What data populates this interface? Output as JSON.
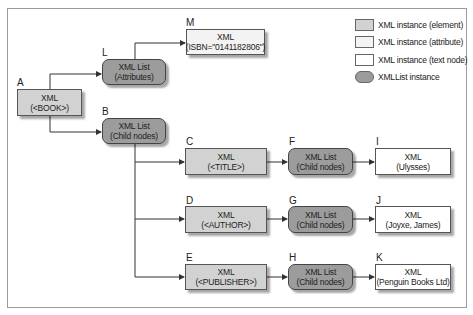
{
  "diagram": {
    "colors": {
      "element": "#d2d2d2",
      "attribute": "#f3f3f3",
      "text_node": "#ffffff",
      "list": "#9c9c9c",
      "line": "#333333"
    },
    "nodes": {
      "A": {
        "letter": "A",
        "type": "element",
        "line1": "XML",
        "line2": "(<BOOK>)"
      },
      "L": {
        "letter": "L",
        "type": "list",
        "line1": "XML List",
        "line2": "(Attributes)"
      },
      "M": {
        "letter": "M",
        "type": "attribute",
        "line1": "XML",
        "line2": "(ISBN=\"0141182806\")"
      },
      "B": {
        "letter": "B",
        "type": "list",
        "line1": "XML List",
        "line2": "(Child nodes)"
      },
      "C": {
        "letter": "C",
        "type": "element",
        "line1": "XML",
        "line2": "(<TITLE>)"
      },
      "D": {
        "letter": "D",
        "type": "element",
        "line1": "XML",
        "line2": "(<AUTHOR>)"
      },
      "E": {
        "letter": "E",
        "type": "element",
        "line1": "XML",
        "line2": "(<PUBLISHER>)"
      },
      "F": {
        "letter": "F",
        "type": "list",
        "line1": "XML List",
        "line2": "(Child nodes)"
      },
      "G": {
        "letter": "G",
        "type": "list",
        "line1": "XML List",
        "line2": "(Child nodes)"
      },
      "H": {
        "letter": "H",
        "type": "list",
        "line1": "XML List",
        "line2": "(Child nodes)"
      },
      "I": {
        "letter": "I",
        "type": "text",
        "line1": "XML",
        "line2": "(Ulysses)"
      },
      "J": {
        "letter": "J",
        "type": "text",
        "line1": "XML",
        "line2": "(Joyxe, James)"
      },
      "K": {
        "letter": "K",
        "type": "text",
        "line1": "XML",
        "line2": "(Penguin Books Ltd)"
      }
    },
    "edges": [
      [
        "A",
        "L"
      ],
      [
        "A",
        "B"
      ],
      [
        "L",
        "M"
      ],
      [
        "B",
        "C"
      ],
      [
        "B",
        "D"
      ],
      [
        "B",
        "E"
      ],
      [
        "C",
        "F"
      ],
      [
        "D",
        "G"
      ],
      [
        "E",
        "H"
      ],
      [
        "F",
        "I"
      ],
      [
        "G",
        "J"
      ],
      [
        "H",
        "K"
      ]
    ]
  },
  "legend": {
    "items": [
      {
        "swatch": "element",
        "label": "XML instance (element)"
      },
      {
        "swatch": "attribute",
        "label": "XML instance (attribute)"
      },
      {
        "swatch": "text",
        "label": "XML instance (text node)"
      },
      {
        "swatch": "list",
        "label": "XMLList instance"
      }
    ]
  }
}
